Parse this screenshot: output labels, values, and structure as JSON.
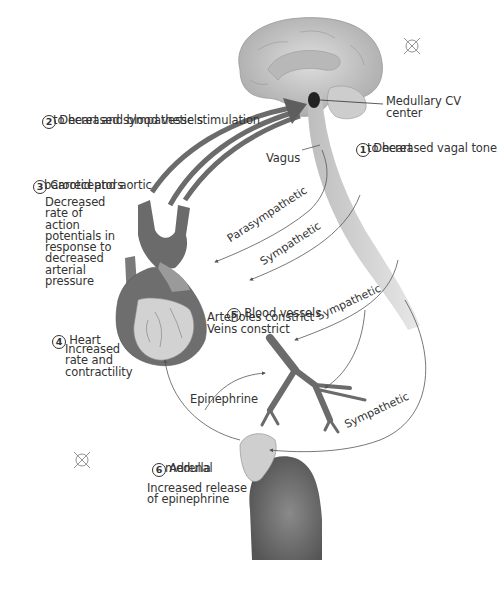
{
  "colors": {
    "vessel": "#6b6b6b",
    "tissue": "#c9c9c9",
    "nerve": "#cfcfcf",
    "arrow": "#595959",
    "line": "#555555",
    "text": "#333333"
  },
  "steps": [
    {
      "number": "1",
      "title": "Decreased vagal tone",
      "detail": "to heart"
    },
    {
      "number": "2",
      "title": "Decreased sympathetic stimulation",
      "detail": "to heart and blood vessels"
    },
    {
      "number": "3",
      "title": "Carotid and aortic",
      "detail": "baroreceptors",
      "description": "Decreased\nrate of\naction\npotentials in\nresponse to\ndecreased\narterial\npressure"
    },
    {
      "number": "4",
      "title": "Heart",
      "description": "Increased\nrate and\ncontractility"
    },
    {
      "number": "5",
      "title": "Blood vessels",
      "description": "Arterioles constrict\nVeins constrict"
    },
    {
      "number": "6",
      "title": "Adrenal",
      "detail": "medulla",
      "description": "Increased release\nof epinephrine"
    }
  ],
  "labels": {
    "medullary": "Medullary CV\ncenter",
    "vagus": "Vagus",
    "parasympathetic": "Parasympathetic",
    "sympathetic": "Sympathetic",
    "epinephrine": "Epinephrine"
  },
  "marks": [
    "registration-mark",
    "registration-mark"
  ]
}
